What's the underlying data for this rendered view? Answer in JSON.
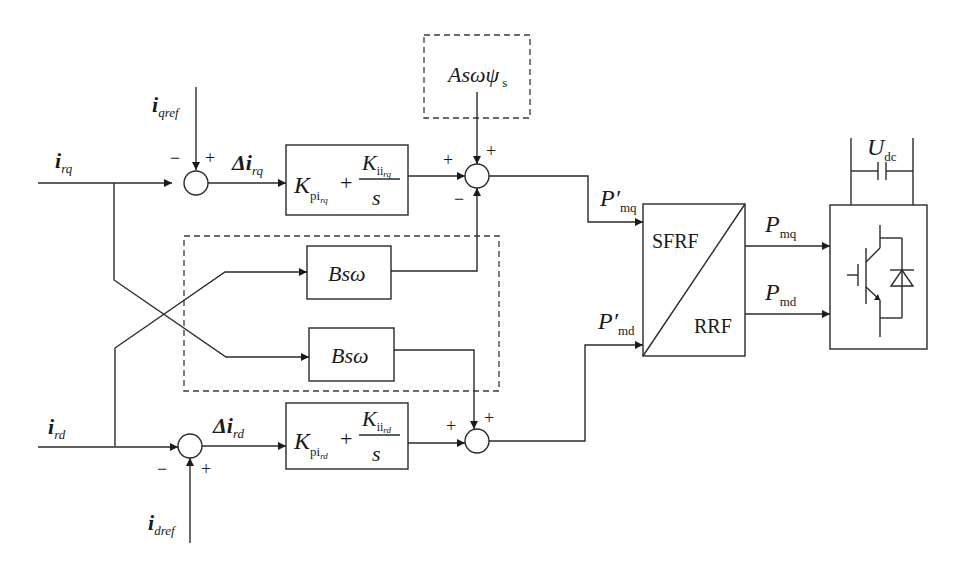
{
  "diagram": {
    "inputs": {
      "irq": {
        "main": "i",
        "sub": "rq"
      },
      "ird": {
        "main": "i",
        "sub": "rd"
      },
      "iqref": {
        "main": "i",
        "sub": "qref"
      },
      "idref": {
        "main": "i",
        "sub": "dref"
      }
    },
    "errors": {
      "delta_irq": {
        "main": "Δi",
        "sub": "rq"
      },
      "delta_ird": {
        "main": "Δi",
        "sub": "rd"
      }
    },
    "pi_blocks": {
      "q": {
        "kp": "K",
        "kp_sub": "pi",
        "kp_subsub": "rq",
        "plus": "+",
        "ki": "K",
        "ki_sub": "ii",
        "ki_subsub": "rq",
        "den": "s"
      },
      "d": {
        "kp": "K",
        "kp_sub": "pi",
        "kp_subsub": "rd",
        "plus": "+",
        "ki": "K",
        "ki_sub": "ii",
        "ki_subsub": "rd",
        "den": "s"
      }
    },
    "feedforward": {
      "label": "Asωψ",
      "sub": "s"
    },
    "coupling_blocks": [
      {
        "label": "Bsω"
      },
      {
        "label": "Bsω"
      }
    ],
    "signals": {
      "pmq_prime": {
        "main": "P′",
        "sub": "mq"
      },
      "pmd_prime": {
        "main": "P′",
        "sub": "md"
      },
      "pmq": {
        "main": "P",
        "sub": "mq"
      },
      "pmd": {
        "main": "P",
        "sub": "md"
      },
      "udc": {
        "main": "U",
        "sub": "dc"
      }
    },
    "transform_block": {
      "top_label": "SFRF",
      "bottom_label": "RRF"
    },
    "signs": {
      "sum_q1": {
        "left": "−",
        "top": "+"
      },
      "sum_q2": {
        "left": "+",
        "top": "+",
        "bottom": "−"
      },
      "sum_d1": {
        "left": "−",
        "bottom": "+"
      },
      "sum_d2": {
        "left": "+",
        "top": "+"
      }
    },
    "colors": {
      "line": "#2a2a2a",
      "background": "#ffffff"
    }
  }
}
